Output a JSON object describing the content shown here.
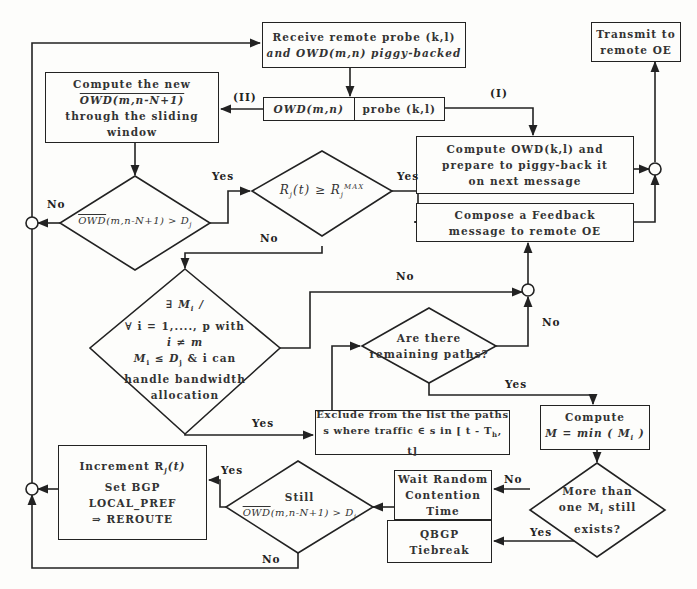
{
  "boxes": {
    "receive": {
      "line1": "Receive remote probe (k,l)",
      "line2": "and OWD(m,n) piggy-backed"
    },
    "transmit": {
      "line1": "Transmit to",
      "line2": "remote OE"
    },
    "compute_new": {
      "line1": "Compute the new",
      "line2": "OWD(m,n-N+1)",
      "line3": "through the sliding window"
    },
    "split_left": "OWD(m,n)",
    "split_right": "probe (k,l)",
    "compute_owd": {
      "line1": "Compute OWD(k,l) and",
      "line2": "prepare to piggy-back it",
      "line3": "on next message"
    },
    "compose": {
      "line1": "Compose a Feedback",
      "line2": "message to remote OE"
    },
    "exclude": {
      "line1": "Exclude from the list the paths",
      "line2": "s where traffic ∈ s in [ t - T",
      "line2_sub": "h",
      "line2_end": ", t]"
    },
    "compute_m": {
      "line1": "Compute",
      "line2": "M = min ( M",
      "line2_sub": "i",
      "line2_end": " )"
    },
    "increment": {
      "line1": "Increment R",
      "line1_sub": "j",
      "line1_end": "(t)",
      "line2": "Set BGP",
      "line3": "LOCAL_PREF",
      "line4": "⇒ REROUTE"
    },
    "wait": {
      "line1": "Wait Random",
      "line2": "Contention",
      "line3": "Time"
    },
    "qbgp": {
      "line1": "QBGP",
      "line2": "Tiebreak"
    }
  },
  "decisions": {
    "owd_gt_d": {
      "left": "OWD",
      "mid": "(m,n-N+1) > D",
      "sub": "j"
    },
    "r_ge_rmax": {
      "a": "R",
      "a_sub": "j",
      "b": "(t)  ≥  R",
      "b_sub": "j",
      "b_sup": "MAX"
    },
    "exists_mi": {
      "line1": "∃ M",
      "line1_sub": "i",
      "line1_end": " /",
      "line2": "∀ i = 1,...., p  with",
      "line3": "i ≠ m",
      "line4a": "M",
      "line4_sub": "i",
      "line4b": " ≤ D",
      "line4_sub2": "j",
      "line4c": "  &  i can",
      "line5": "handle bandwidth",
      "line6": "allocation"
    },
    "remaining": {
      "line1": "Are there",
      "line2": "remaining paths?"
    },
    "more_than_one": {
      "line1": "More than",
      "line2a": "one M",
      "line2_sub": "i",
      "line2b": " still",
      "line3": "exists?"
    },
    "still": {
      "line1": "Still",
      "line2a": "OWD",
      "line2b": "(m,n-N+1) > D",
      "line2_sub": "j"
    }
  },
  "labels": {
    "II": "(II)",
    "I": "(I)",
    "yes": "Yes",
    "no": "No"
  },
  "colors": {
    "line": "#222222",
    "background": "#fdfdfb",
    "text": "#333333"
  }
}
